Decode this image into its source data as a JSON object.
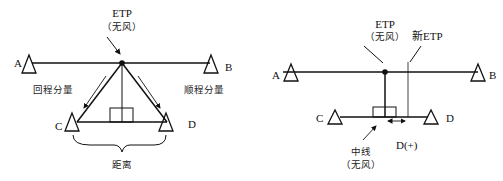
{
  "left_diagram": {
    "etp_label": "ETP",
    "etp_sub": "（无风）",
    "points": {
      "A": "A",
      "B": "B",
      "C": "C",
      "D": "D"
    },
    "return_component": "回程分量",
    "outbound_component": "顺程分量",
    "distance": "距离"
  },
  "right_diagram": {
    "etp_label": "ETP",
    "etp_sub": "（无风）",
    "new_etp": "新ETP",
    "points": {
      "A": "A",
      "B": "B",
      "C": "C",
      "D": "D"
    },
    "midline": "中线",
    "midline_sub": "（无风）",
    "d_plus": "D(+)"
  }
}
